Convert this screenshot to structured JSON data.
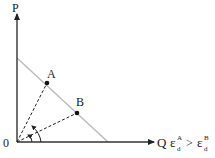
{
  "diagram": {
    "axes": {
      "y_label": "P",
      "x_label": "Q",
      "origin_label": "0"
    },
    "demand_line": {
      "color": "#b8b8b8"
    },
    "points": [
      {
        "label": "A"
      },
      {
        "label": "B"
      }
    ],
    "relation": {
      "symbol": "ε",
      "sub": "d",
      "sup_a": "A",
      "sup_b": "B",
      "operator": ">"
    },
    "colors": {
      "ink": "#222222",
      "line": "#b8b8b8"
    }
  }
}
